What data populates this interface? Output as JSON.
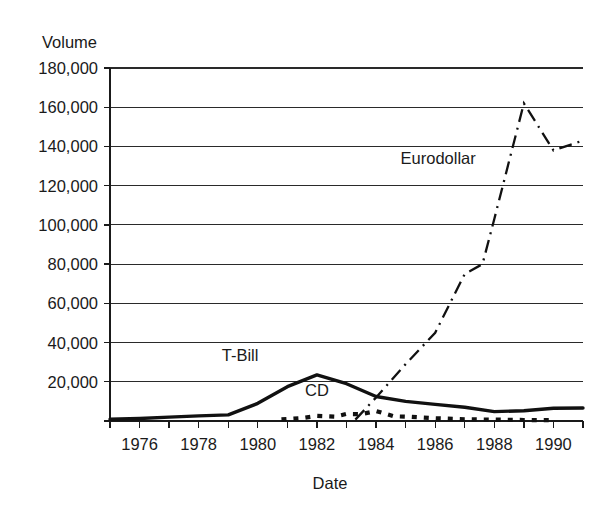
{
  "chart_data": {
    "type": "line",
    "title": "",
    "xlabel": "Date",
    "ylabel": "Volume",
    "xlim": [
      1975,
      1991
    ],
    "ylim": [
      0,
      180000
    ],
    "grid": true,
    "legend_position": "inline-annotations",
    "y_ticks": [
      0,
      20000,
      40000,
      60000,
      80000,
      100000,
      120000,
      140000,
      160000,
      180000
    ],
    "y_tick_labels": [
      "",
      "20,000",
      "40,000",
      "60,000",
      "80,000",
      "100,000",
      "120,000",
      "140,000",
      "160,000",
      "180,000"
    ],
    "x_ticks": [
      1975,
      1976,
      1977,
      1978,
      1979,
      1980,
      1981,
      1982,
      1983,
      1984,
      1985,
      1986,
      1987,
      1988,
      1989,
      1990,
      1991
    ],
    "x_tick_labels": [
      "",
      "1976",
      "",
      "1978",
      "",
      "1980",
      "",
      "1982",
      "",
      "1984",
      "",
      "1986",
      "",
      "1988",
      "",
      "1990",
      ""
    ],
    "series": [
      {
        "name": "T-Bill",
        "style": "solid",
        "label_x": 1979.4,
        "label_y": 30500,
        "x": [
          1975,
          1976,
          1977,
          1978,
          1979,
          1980,
          1981,
          1982,
          1983,
          1984,
          1985,
          1986,
          1987,
          1988,
          1989,
          1990,
          1991
        ],
        "values": [
          900,
          1300,
          2000,
          2600,
          3100,
          9000,
          17500,
          23500,
          19000,
          12500,
          10000,
          8500,
          7000,
          4800,
          5200,
          6500,
          6600
        ]
      },
      {
        "name": "Eurodollar",
        "style": "dash-dot",
        "label_x": 1986.1,
        "label_y": 131000,
        "x": [
          1983.3,
          1984,
          1985,
          1986,
          1987,
          1987.6,
          1988,
          1989,
          1990,
          1991
        ],
        "values": [
          700,
          12000,
          29000,
          45000,
          75000,
          80000,
          103000,
          162000,
          138000,
          143000
        ]
      },
      {
        "name": "CD",
        "style": "dotted",
        "label_x": 1982.0,
        "label_y": 12500,
        "x": [
          1980.8,
          1981.5,
          1982,
          1982.6,
          1983,
          1983.5,
          1984,
          1984.6,
          1985.2,
          1986,
          1987,
          1988,
          1989,
          1990
        ],
        "values": [
          800,
          1500,
          2600,
          2200,
          3600,
          3500,
          5100,
          2400,
          2100,
          1400,
          900,
          700,
          500,
          400
        ]
      }
    ]
  },
  "axis": {
    "y_title": "Volume",
    "x_title": "Date"
  }
}
